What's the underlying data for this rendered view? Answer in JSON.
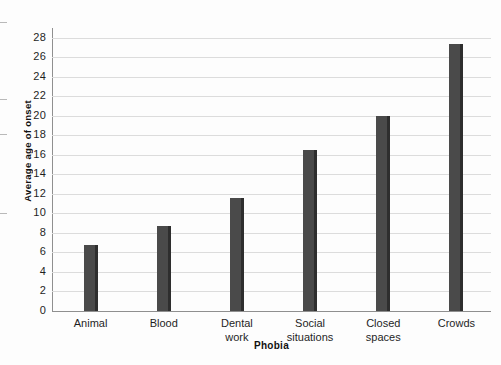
{
  "chart_data": {
    "type": "bar",
    "title": "",
    "xlabel": "Phobia",
    "ylabel": "Average age of onset",
    "categories": [
      "Animal",
      "Blood",
      "Dental\nwork",
      "Social\nsituations",
      "Closed\nspaces",
      "Crowds"
    ],
    "values": [
      6.8,
      8.7,
      11.6,
      16.5,
      20.0,
      27.4
    ],
    "ylim": [
      0,
      29
    ],
    "yticks": [
      0,
      2,
      4,
      6,
      8,
      10,
      12,
      14,
      16,
      18,
      20,
      22,
      24,
      26,
      28
    ],
    "ytick_labels": [
      "0",
      "2",
      "4",
      "6",
      "8",
      "10",
      "12",
      "14",
      "16",
      "18",
      "20",
      "22",
      "24",
      "26",
      "28"
    ],
    "grid": true,
    "legend": null,
    "series": [
      {
        "name": "Average age of onset",
        "values": [
          6.8,
          8.7,
          11.6,
          16.5,
          20.0,
          27.4
        ],
        "color": "#4a4a4a"
      }
    ],
    "colors": {
      "bar_fill": "#4a4a4a",
      "bar_edge": "#2e2e2e",
      "gridline": "#dcdcdc",
      "axis": "#8f8f8f",
      "background": "#fdfdfd",
      "text": "#1f1f1f"
    }
  }
}
